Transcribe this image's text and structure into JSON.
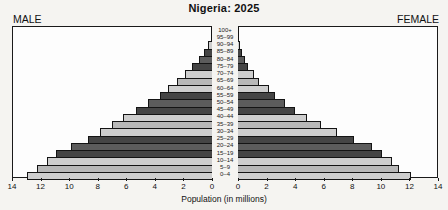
{
  "title": "Nigeria: 2025",
  "male_label": "MALE",
  "female_label": "FEMALE",
  "chart_data": {
    "type": "bar",
    "subtype": "population-pyramid",
    "title": "Nigeria: 2025",
    "xlabel": "Population (in millions)",
    "left_series_name": "MALE",
    "right_series_name": "FEMALE",
    "axis_range_millions": [
      0,
      14
    ],
    "tick_step": 2,
    "left_tick_labels": [
      "14",
      "12",
      "10",
      "8",
      "6",
      "4",
      "2",
      "0"
    ],
    "right_tick_labels": [
      "0",
      "2",
      "4",
      "6",
      "8",
      "10",
      "12",
      "14"
    ],
    "grid": false,
    "age_groups_top_to_bottom": [
      "100+",
      "95–99",
      "90–94",
      "85–89",
      "80–84",
      "75–79",
      "70–74",
      "65–69",
      "60–64",
      "55–59",
      "50–54",
      "45–49",
      "40–44",
      "35–39",
      "30–34",
      "25–29",
      "20–24",
      "15–19",
      "10–14",
      "5–9",
      "0–4"
    ],
    "male_millions_top_to_bottom": [
      0.03,
      0.1,
      0.25,
      0.55,
      0.95,
      1.4,
      1.9,
      2.5,
      3.1,
      3.7,
      4.5,
      5.4,
      6.3,
      7.1,
      7.95,
      8.8,
      9.95,
      11.05,
      11.7,
      12.35,
      13.1
    ],
    "female_millions_top_to_bottom": [
      0.02,
      0.07,
      0.15,
      0.3,
      0.5,
      0.7,
      1.1,
      1.5,
      2.2,
      2.6,
      3.3,
      4.05,
      4.9,
      5.9,
      7.0,
      8.2,
      9.45,
      10.2,
      10.9,
      11.4,
      12.2
    ],
    "row_colors_top_to_bottom": [
      "#cecece",
      "#b8b8b8",
      "#cecece",
      "#454545",
      "#5c5c5c",
      "#454545",
      "#cecece",
      "#b8b8b8",
      "#cecece",
      "#454545",
      "#5c5c5c",
      "#454545",
      "#cecece",
      "#b8b8b8",
      "#cecece",
      "#454545",
      "#5c5c5c",
      "#454545",
      "#cecece",
      "#b8b8b8",
      "#cecece"
    ],
    "bar_outline_color": "#141414",
    "panel_background": "#fdfdfd",
    "page_background": "#f5f4f1"
  }
}
